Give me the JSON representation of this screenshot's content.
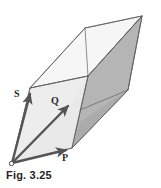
{
  "figure": {
    "caption": "Fig. 3.25",
    "type": "geometric-diagram",
    "origin_marker": "open-circle",
    "vectors": [
      {
        "id": "P",
        "label": "P",
        "description": "vector from origin toward lower right"
      },
      {
        "id": "Q",
        "label": "Q",
        "description": "vector from origin toward middle right, interior diagonal edge"
      },
      {
        "id": "S",
        "label": "S",
        "description": "vector from origin toward upper left edge"
      }
    ],
    "colors": {
      "outline": "#5d5d5d",
      "vector_stroke": "#555555",
      "face_top": "#f4f4f4",
      "face_left": "#ececec",
      "face_front": "#e3e3e3",
      "face_shaded": "#b4b4b4",
      "face_shaded_lower": "#a9a9a9",
      "background": "#ffffff",
      "label_text": "#2b2b2b",
      "caption_text": "#262626"
    }
  }
}
